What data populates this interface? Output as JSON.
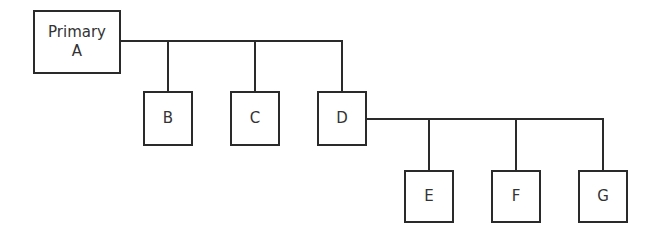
{
  "diagram": {
    "type": "hierarchy",
    "root": {
      "label_line1": "Primary",
      "label_line2": "A"
    },
    "level1": [
      {
        "label": "B"
      },
      {
        "label": "C"
      },
      {
        "label": "D"
      }
    ],
    "level2_parent": "D",
    "level2": [
      {
        "label": "E"
      },
      {
        "label": "F"
      },
      {
        "label": "G"
      }
    ],
    "colors": {
      "stroke": "#2a2a2a",
      "background": "#ffffff"
    }
  }
}
